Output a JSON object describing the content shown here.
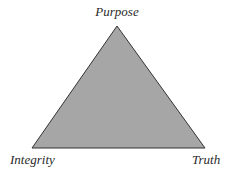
{
  "diagram": {
    "type": "triangle",
    "fill_color": "#a6a6a6",
    "stroke_color": "#333333",
    "vertices": {
      "top": {
        "label": "Purpose",
        "x": 117,
        "y": 26
      },
      "bottom_left": {
        "label": "Integrity",
        "x": 32,
        "y": 148
      },
      "bottom_right": {
        "label": "Truth",
        "x": 205,
        "y": 148
      }
    }
  }
}
